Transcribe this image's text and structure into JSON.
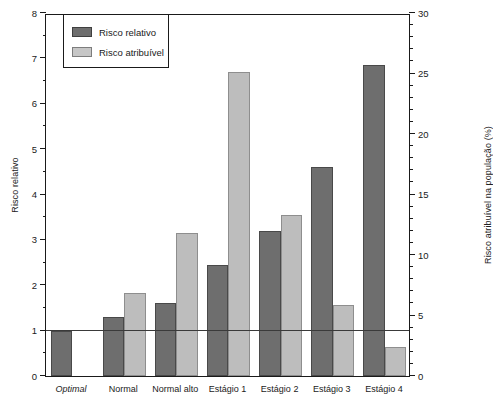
{
  "chart_data": {
    "type": "bar",
    "title": "",
    "categories": [
      "Optimal",
      "Normal",
      "Normal alto",
      "Estágio 1",
      "Estágio 2",
      "Estágio 3",
      "Estágio 4"
    ],
    "series": [
      {
        "name": "Risco relativo",
        "axis": "left",
        "color": "#6e6e6e",
        "values": [
          1.0,
          1.3,
          1.6,
          2.45,
          3.2,
          4.6,
          6.85
        ]
      },
      {
        "name": "Risco atribuível",
        "axis": "right",
        "color": "#bdbdbd",
        "values": [
          0,
          6.9,
          11.8,
          25.1,
          13.3,
          5.9,
          2.4
        ]
      }
    ],
    "xlabel": "",
    "ylabel": "Risco relativo",
    "ylabel_right": "Risco atribuível na população (%)",
    "ylim": [
      0,
      8
    ],
    "ylim_right": [
      0,
      30
    ],
    "yticks": [
      0,
      1,
      2,
      3,
      4,
      5,
      6,
      7,
      8
    ],
    "yticks_right": [
      0,
      5,
      10,
      15,
      20,
      25,
      30
    ],
    "minor_tick_step_left": 0.5,
    "minor_tick_step_right": 1,
    "grid": false,
    "reference_line": 1.0,
    "legend_position": "top-left",
    "italic_categories": [
      "Optimal"
    ]
  },
  "axes": {
    "left_title": "Risco relativo",
    "right_title": "Risco atribuível na população (%)",
    "left_ticks": [
      "0",
      "1",
      "2",
      "3",
      "4",
      "5",
      "6",
      "7",
      "8"
    ],
    "right_ticks": [
      "0",
      "5",
      "10",
      "15",
      "20",
      "25",
      "30"
    ]
  },
  "legend": {
    "items": [
      {
        "label": "Risco relativo",
        "color": "#6e6e6e"
      },
      {
        "label": "Risco atribuível",
        "color": "#bdbdbd"
      }
    ]
  },
  "categories": [
    "Optimal",
    "Normal",
    "Normal alto",
    "Estágio 1",
    "Estágio 2",
    "Estágio 3",
    "Estágio 4"
  ]
}
